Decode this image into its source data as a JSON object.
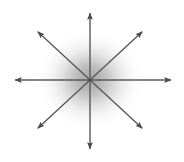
{
  "figure": {
    "canvas": {
      "width": 184,
      "height": 162,
      "background_color": "#ffffff"
    },
    "center": {
      "x": 90,
      "y": 80,
      "label": "origin"
    },
    "blob": {
      "name": "radial-gradient-blob",
      "center_x": 90,
      "center_y": 80,
      "radius_x": 52,
      "radius_y": 48,
      "core_color": "#a9a9a9",
      "mid_color": "#c9c9c9",
      "edge_color": "#ffffff",
      "core_opacity": 0.95
    },
    "arrow_style": {
      "stroke_color": "#5a5a5a",
      "stroke_width": 1.4,
      "head_fill": "#4a4a4a",
      "head_length": 9,
      "head_width": 7
    },
    "arrows": [
      {
        "name": "arrow-up",
        "direction": "up",
        "angle_deg": 90,
        "tip_x": 90,
        "tip_y": 12,
        "length": 68
      },
      {
        "name": "arrow-up-right",
        "direction": "up-right",
        "angle_deg": 45,
        "tip_x": 143,
        "tip_y": 31,
        "length": 71
      },
      {
        "name": "arrow-right",
        "direction": "right",
        "angle_deg": 0,
        "tip_x": 172,
        "tip_y": 80,
        "length": 82
      },
      {
        "name": "arrow-down-right",
        "direction": "down-right",
        "angle_deg": -45,
        "tip_x": 143,
        "tip_y": 129,
        "length": 71
      },
      {
        "name": "arrow-down",
        "direction": "down",
        "angle_deg": -90,
        "tip_x": 90,
        "tip_y": 150,
        "length": 70
      },
      {
        "name": "arrow-down-left",
        "direction": "down-left",
        "angle_deg": -135,
        "tip_x": 37,
        "tip_y": 129,
        "length": 71
      },
      {
        "name": "arrow-left",
        "direction": "left",
        "angle_deg": 180,
        "tip_x": 14,
        "tip_y": 80,
        "length": 76
      },
      {
        "name": "arrow-up-left",
        "direction": "up-left",
        "angle_deg": 135,
        "tip_x": 37,
        "tip_y": 31,
        "length": 71
      }
    ],
    "arrow_count": 8
  }
}
